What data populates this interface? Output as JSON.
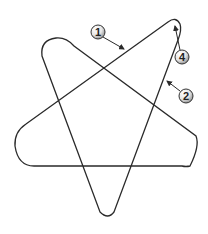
{
  "diagram": {
    "title": "",
    "shape": "rounded pentagram (continuous looped curve)",
    "stroke_color": "#2a2a2a",
    "background": "#ffffff",
    "callouts": [
      {
        "label": "1",
        "cx": 98,
        "cy": 32,
        "arrow_to": [
          124,
          49
        ]
      },
      {
        "label": "4",
        "cx": 182,
        "cy": 57,
        "arrow_to": [
          174,
          25
        ]
      },
      {
        "label": "2",
        "cx": 186,
        "cy": 96,
        "arrow_to": [
          166,
          81
        ]
      }
    ]
  }
}
